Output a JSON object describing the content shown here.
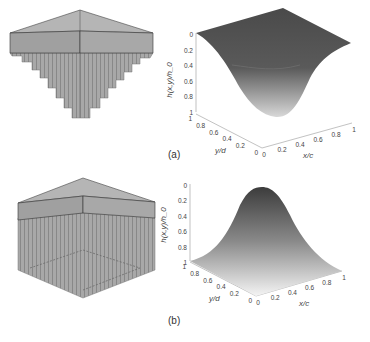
{
  "figure": {
    "panels": [
      {
        "label": "(a)",
        "description": "array of pillars hanging under a plate, lengths decreasing outward (inverted pyramid)",
        "surface_shape": "bowl",
        "zlabel": "h(x,y)/h_0",
        "xlabel": "x/c",
        "ylabel": "y/d",
        "z_ticks": [
          "0",
          "0.2",
          "0.4",
          "0.6",
          "0.8",
          "1"
        ],
        "x_ticks": [
          "0",
          "0.2",
          "0.4",
          "0.6",
          "0.8",
          "1"
        ],
        "y_ticks": [
          "0",
          "0.2",
          "0.4",
          "0.6",
          "0.8",
          "1"
        ]
      },
      {
        "label": "(b)",
        "description": "array of pillars hanging under a plate, uniform long pillars with shorter centre",
        "surface_shape": "dome",
        "zlabel": "h(x,y)/h_0",
        "xlabel": "x/c",
        "ylabel": "y/d",
        "z_ticks": [
          "0",
          "0.2",
          "0.4",
          "0.6",
          "0.8",
          "1"
        ],
        "x_ticks": [
          "0",
          "0.2",
          "0.4",
          "0.6",
          "0.8",
          "1"
        ],
        "y_ticks": [
          "0",
          "0.2",
          "0.4",
          "0.6",
          "0.8",
          "1"
        ]
      }
    ]
  },
  "chart_data": [
    {
      "type": "surface",
      "title": "(a)",
      "xlabel": "x/c",
      "ylabel": "y/d",
      "zlabel": "h(x,y)/h0",
      "xlim": [
        0,
        1
      ],
      "ylim": [
        0,
        1
      ],
      "zlim": [
        0,
        1
      ],
      "z_reversed": true,
      "function": "h/h0 = sin(pi x) * sin(pi y) (bowl; max 1 at centre, 0 at edges)",
      "center_value": 1,
      "edge_value": 0
    },
    {
      "type": "surface",
      "title": "(b)",
      "xlabel": "x/c",
      "ylabel": "y/d",
      "zlabel": "h(x,y)/h0",
      "xlim": [
        0,
        1
      ],
      "ylim": [
        0,
        1
      ],
      "zlim": [
        0,
        1
      ],
      "z_reversed": true,
      "function": "h/h0 = 1 - sin(pi x) * sin(pi y) (dome; 0 at centre, 1 at edges)",
      "center_value": 0,
      "edge_value": 1
    }
  ]
}
